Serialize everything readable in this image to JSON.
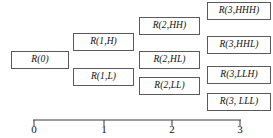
{
  "diagram": {
    "background_color": "#ffffff",
    "box_border_color": "#5a5a5a",
    "text_color": "#111111",
    "axis_color": "#3a3a3a",
    "nodes": [
      {
        "label": "R(0)",
        "step": 0,
        "x": 11,
        "y": 51,
        "w": 58,
        "h": 18
      },
      {
        "label": "R(1,H)",
        "step": 1,
        "x": 73,
        "y": 33,
        "w": 61,
        "h": 18
      },
      {
        "label": "R(1,L)",
        "step": 1,
        "x": 73,
        "y": 68,
        "w": 61,
        "h": 18
      },
      {
        "label": "R(2,HH)",
        "step": 2,
        "x": 139,
        "y": 17,
        "w": 61,
        "h": 18
      },
      {
        "label": "R(2,HL)",
        "step": 2,
        "x": 139,
        "y": 51,
        "w": 61,
        "h": 18
      },
      {
        "label": "R(2,LL)",
        "step": 2,
        "x": 139,
        "y": 77,
        "w": 61,
        "h": 18
      },
      {
        "label": "R(3,HHH)",
        "step": 3,
        "x": 207,
        "y": 2,
        "w": 64,
        "h": 18
      },
      {
        "label": "R(3,HHL)",
        "step": 3,
        "x": 207,
        "y": 36,
        "w": 64,
        "h": 18
      },
      {
        "label": "R(3,LLH)",
        "step": 3,
        "x": 207,
        "y": 66,
        "w": 64,
        "h": 18
      },
      {
        "label": "R(3, LLL)",
        "step": 3,
        "x": 207,
        "y": 93,
        "w": 64,
        "h": 18
      }
    ],
    "axis": {
      "orientation": "horizontal",
      "line_x_start": 33,
      "line_x_end": 241,
      "line_y": 120,
      "tick_height": 6,
      "ticks": [
        {
          "label": "0",
          "x": 34
        },
        {
          "label": "1",
          "x": 104
        },
        {
          "label": "2",
          "x": 172
        },
        {
          "label": "3",
          "x": 240
        }
      ]
    }
  }
}
